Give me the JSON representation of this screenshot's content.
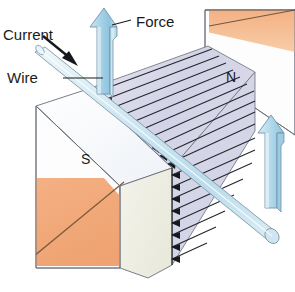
{
  "figure": {
    "background_color": "#ffffff"
  },
  "labels": {
    "current": "Current",
    "wire": "Wire",
    "force": "Force",
    "north_pole": "N",
    "south_pole": "S"
  },
  "colors": {
    "magnet_face": "#fdfdfd",
    "magnet_top": "#f2f5f9",
    "magnet_pole_orange": "#f2ab79",
    "magnet_pole_orange_light": "#f6c49c",
    "magnet_cream": "#eeeee3",
    "field_region": "#d9d9ea",
    "field_region_dark": "#c6c7de",
    "field_line": "#23252b",
    "arrow_blue_light": "#d9edf6",
    "arrow_blue_mid": "#a8d4e8",
    "arrow_blue_dark": "#7fbcd9",
    "wire_fill": "#d6eaf3",
    "wire_edge": "#7f9aa8",
    "outline": "#6b6f7a",
    "text": "#1a1a1a"
  },
  "elements": {
    "magnet_left": {
      "name": "south-pole-magnet-block",
      "pole": "S",
      "has_orange_band": true
    },
    "magnet_right": {
      "name": "north-pole-magnet-block",
      "pole": "N",
      "has_orange_band": true
    },
    "field_lines": {
      "count": 16,
      "direction": "north-to-south",
      "arrow_position": "left-end"
    },
    "wire": {
      "orientation": "diagonal from upper-left to lower-right",
      "current_direction": "down-right"
    },
    "force_arrows": [
      {
        "name": "force-arrow-main",
        "direction": "up",
        "labelled": true
      },
      {
        "name": "force-arrow-secondary",
        "direction": "up",
        "labelled": false
      }
    ]
  }
}
